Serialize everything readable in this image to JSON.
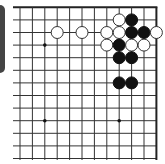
{
  "board": {
    "title": "Go board diagram (upper-right region)",
    "visible_columns": 12,
    "visible_rows": 13,
    "origin_x": 20,
    "origin_y": 7.3,
    "spacing_x": 12.4,
    "spacing_y": 12.6,
    "line_left_extend": 13,
    "line_bottom_extend": 160,
    "top_edge": true,
    "right_edge": true,
    "stone_radius": 6,
    "colors": {
      "line": "#333333",
      "edge": "#222222",
      "black_stone": "#111111",
      "white_stone_fill": "#ffffff",
      "white_stone_stroke": "#333333",
      "star_point": "#111111",
      "panel": "#444444"
    },
    "star_points": [
      {
        "col": 2,
        "row": 3
      },
      {
        "col": 2,
        "row": 9
      },
      {
        "col": 8,
        "row": 9
      }
    ],
    "stones": [
      {
        "color": "white",
        "col": 8,
        "row": 1
      },
      {
        "color": "black",
        "col": 9,
        "row": 1
      },
      {
        "color": "white",
        "col": 3,
        "row": 2
      },
      {
        "color": "white",
        "col": 5,
        "row": 2
      },
      {
        "color": "white",
        "col": 7,
        "row": 2
      },
      {
        "color": "white",
        "col": 8,
        "row": 2
      },
      {
        "color": "black",
        "col": 9,
        "row": 2
      },
      {
        "color": "black",
        "col": 10,
        "row": 2
      },
      {
        "color": "white",
        "col": 11,
        "row": 2
      },
      {
        "color": "white",
        "col": 7,
        "row": 3
      },
      {
        "color": "black",
        "col": 8,
        "row": 3
      },
      {
        "color": "white",
        "col": 9,
        "row": 3
      },
      {
        "color": "white",
        "col": 10,
        "row": 3
      },
      {
        "color": "black",
        "col": 8,
        "row": 4
      },
      {
        "color": "black",
        "col": 9,
        "row": 4
      },
      {
        "color": "black",
        "col": 8,
        "row": 6
      },
      {
        "color": "black",
        "col": 9,
        "row": 6
      }
    ]
  },
  "summary": {
    "black_count": "8",
    "white_count": "9"
  }
}
